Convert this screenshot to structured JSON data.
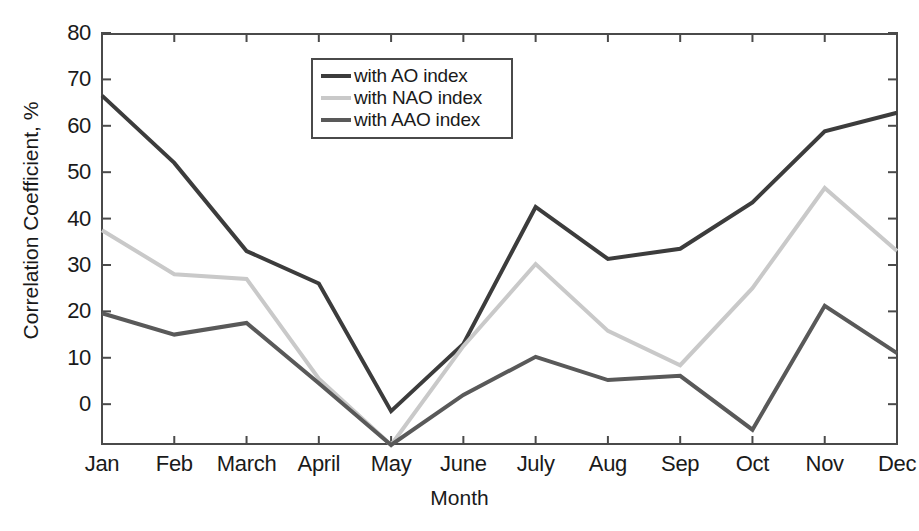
{
  "chart_data": {
    "type": "line",
    "title": "",
    "xlabel": "Month",
    "ylabel": "Correlation Coefficient, %",
    "categories": [
      "Jan",
      "Feb",
      "March",
      "April",
      "May",
      "June",
      "July",
      "Aug",
      "Sep",
      "Oct",
      "Nov",
      "Dec"
    ],
    "ytick_labels": [
      "80",
      "70",
      "60",
      "50",
      "40",
      "30",
      "20",
      "10",
      "0"
    ],
    "ytick_values": [
      80,
      70,
      60,
      50,
      40,
      30,
      20,
      10,
      0
    ],
    "ylim": [
      -8.8,
      80
    ],
    "xlim": [
      0,
      11
    ],
    "grid": false,
    "legend_position": "upper-center-left",
    "series": [
      {
        "name": "with AO index",
        "color": "#3c3c3c",
        "values": [
          66.5,
          52.0,
          33.0,
          26.0,
          -1.5,
          13.0,
          42.5,
          31.3,
          33.5,
          43.5,
          58.8,
          62.8
        ]
      },
      {
        "name": "with NAO index",
        "color": "#c9c9c9",
        "values": [
          37.5,
          28.0,
          27.0,
          5.5,
          -8.8,
          12.5,
          30.2,
          15.8,
          8.4,
          25.0,
          46.6,
          33.0
        ]
      },
      {
        "name": "with AAO index",
        "color": "#595959",
        "values": [
          19.6,
          15.0,
          17.5,
          4.5,
          -8.8,
          2.0,
          10.2,
          5.2,
          6.1,
          -5.5,
          21.2,
          11.0
        ]
      }
    ]
  },
  "axis": {
    "frame_color": "#4a4a4a",
    "text_color": "#1a1a1a",
    "background": "#ffffff"
  }
}
